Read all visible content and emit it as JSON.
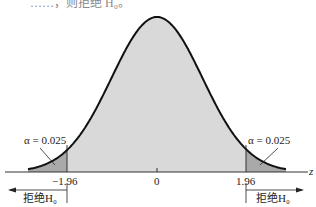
{
  "diagram": {
    "title_fragment": "……，则拒绝 H₀。",
    "distribution": "standard normal",
    "axis_label": "z",
    "ticks": [
      "−1.96",
      "0",
      "1.96"
    ],
    "left_tail": {
      "alpha_label": "α = 0.025",
      "reject_label": "拒绝H₀"
    },
    "right_tail": {
      "alpha_label": "α = 0.025",
      "reject_label": "拒绝H₀"
    },
    "colors": {
      "body_fill": "#d8d8d8",
      "tail_fill": "#a8a8a8",
      "curve": "#111111"
    }
  }
}
